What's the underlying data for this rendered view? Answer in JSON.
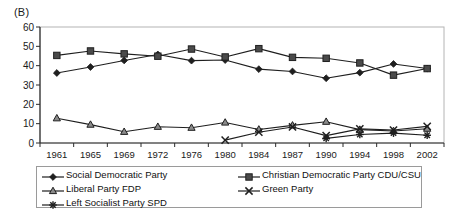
{
  "panel": {
    "label": "(B)"
  },
  "legend": {
    "entries": [
      {
        "label": "Social Democratic Party",
        "marker": "diamond-marker-icon",
        "color": "#1a1a1a"
      },
      {
        "label": "Christian Democratic Party CDU/CSU",
        "marker": "square-marker-icon",
        "color": "#3d3d3d"
      },
      {
        "label": "Liberal Party FDP",
        "marker": "triangle-marker-icon",
        "color": "#5a5a5a"
      },
      {
        "label": "Green Party",
        "marker": "cross-marker-icon",
        "color": "#1a1a1a"
      },
      {
        "label": "Left Socialist Party SPD",
        "marker": "asterisk-marker-icon",
        "color": "#1a1a1a"
      }
    ]
  },
  "chart_data": {
    "type": "line",
    "title": "(B)",
    "xlabel": "",
    "ylabel": "",
    "grid": false,
    "legend_position": "bottom",
    "ylim": [
      0,
      60
    ],
    "yticks": [
      0,
      10,
      20,
      30,
      40,
      50,
      60
    ],
    "categories": [
      "1961",
      "1965",
      "1969",
      "1972",
      "1976",
      "1980",
      "1984",
      "1987",
      "1990",
      "1994",
      "1998",
      "2002"
    ],
    "series": [
      {
        "name": "Social Democratic Party",
        "marker": "diamond",
        "values": [
          36.2,
          39.3,
          42.7,
          45.8,
          42.6,
          42.9,
          38.2,
          37.0,
          33.5,
          36.4,
          40.9,
          38.5
        ]
      },
      {
        "name": "Christian Democratic Party CDU/CSU",
        "marker": "square",
        "values": [
          45.3,
          47.6,
          46.1,
          44.9,
          48.6,
          44.5,
          48.8,
          44.3,
          43.8,
          41.4,
          35.1,
          38.5
        ]
      },
      {
        "name": "Liberal Party FDP",
        "marker": "triangle",
        "values": [
          12.8,
          9.5,
          5.8,
          8.4,
          7.9,
          10.6,
          7.0,
          9.1,
          11.0,
          6.9,
          6.2,
          7.4
        ]
      },
      {
        "name": "Green Party",
        "marker": "cross",
        "values": [
          null,
          null,
          null,
          null,
          null,
          1.5,
          5.6,
          8.3,
          3.8,
          7.3,
          6.7,
          8.6
        ]
      },
      {
        "name": "Left Socialist Party SPD",
        "marker": "asterisk",
        "values": [
          null,
          null,
          null,
          null,
          null,
          null,
          null,
          null,
          2.4,
          4.4,
          5.1,
          4.0
        ]
      }
    ]
  }
}
